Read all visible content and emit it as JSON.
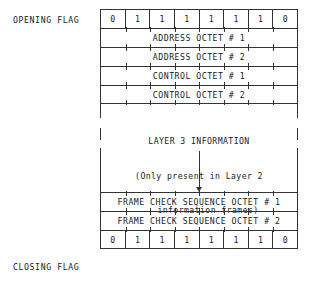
{
  "diagram": {
    "labels": {
      "opening_flag": "OPENING FLAG",
      "closing_flag": "CLOSING FLAG"
    },
    "flag_bits": [
      "0",
      "1",
      "1",
      "1",
      "1",
      "1",
      "1",
      "0"
    ],
    "rows": {
      "address_octet_1": "ADDRESS OCTET # 1",
      "address_octet_2": "ADDRESS OCTET # 2",
      "control_octet_1": "CONTROL OCTET # 1",
      "control_octet_2": "CONTROL OCTET # 2",
      "fcs_octet_1": "FRAME CHECK SEQUENCE   OCTET # 1",
      "fcs_octet_2": "FRAME CHECK SEQUENCE   OCTET # 2"
    },
    "layer3": {
      "line1": "LAYER 3 INFORMATION",
      "line2": "(Only present in Layer 2",
      "line3": "information frames)"
    },
    "colors": {
      "line": "#333333",
      "text": "#1a1a1a",
      "background": "#ffffff"
    }
  }
}
